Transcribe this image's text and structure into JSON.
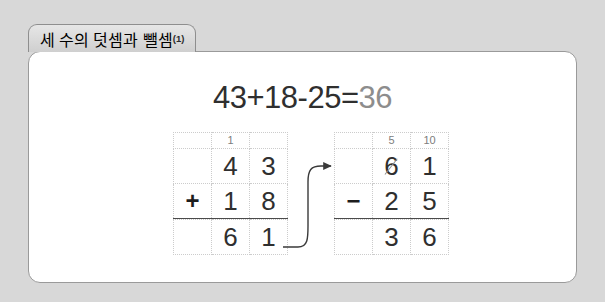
{
  "background_color": "#d8d8d8",
  "tab": {
    "label": "세 수의 덧셈과 뺄셈",
    "suffix": "(1)"
  },
  "panel": {
    "background_color": "#ffffff",
    "border_color": "#9a9a9a"
  },
  "equation": {
    "expression": "43+18-25=",
    "result": "36",
    "result_color": "#8d8d8d",
    "text_color": "#2f2f2f"
  },
  "work": {
    "arrow": {
      "name": "carry-result-arrow",
      "color": "#3a3a3a",
      "description": "curved arrow from left grid result to right grid top row"
    },
    "grids": [
      {
        "id": "left",
        "operation": "addition",
        "carry": {
          "ones": "",
          "tens": "1",
          "hundreds": ""
        },
        "operator": "+",
        "rows": [
          {
            "op": "",
            "tens": "4",
            "ones": "3"
          },
          {
            "op": "+",
            "tens": "1",
            "ones": "8"
          }
        ],
        "answer": {
          "op": "",
          "tens": "6",
          "ones": "1"
        }
      },
      {
        "id": "right",
        "operation": "subtraction",
        "carry": {
          "ones": "",
          "tens": "5",
          "hundreds": "10"
        },
        "operator": "−",
        "rows": [
          {
            "op": "",
            "tens": "6",
            "ones": "1",
            "tens_struck": true
          },
          {
            "op": "−",
            "tens": "2",
            "ones": "5"
          }
        ],
        "answer": {
          "op": "",
          "tens": "3",
          "ones": "6"
        }
      }
    ]
  }
}
